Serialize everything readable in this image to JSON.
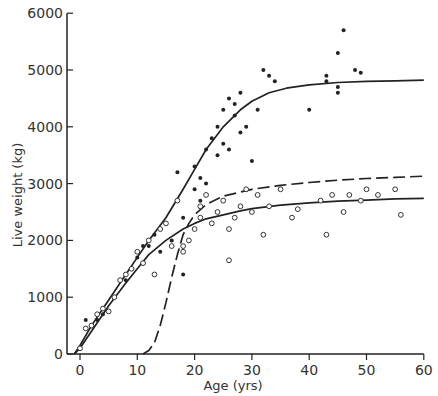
{
  "chart_data": {
    "type": "scatter",
    "title": "",
    "xlabel": "Age (yrs)",
    "ylabel": "Live weight (kg)",
    "xlim": [
      -2,
      60
    ],
    "ylim": [
      0,
      6000
    ],
    "xticks": [
      0,
      10,
      20,
      30,
      40,
      50,
      60
    ],
    "yticks": [
      0,
      1000,
      2000,
      3000,
      4000,
      5000,
      6000
    ],
    "grid": false,
    "legend": null,
    "series": [
      {
        "name": "filled points (males)",
        "marker": "filled-circle",
        "points": [
          [
            1,
            600
          ],
          [
            2,
            500
          ],
          [
            3,
            600
          ],
          [
            4,
            700
          ],
          [
            6,
            1000
          ],
          [
            8,
            1300
          ],
          [
            10,
            1700
          ],
          [
            11,
            1900
          ],
          [
            12,
            1900
          ],
          [
            13,
            2100
          ],
          [
            14,
            1800
          ],
          [
            15,
            2300
          ],
          [
            16,
            2000
          ],
          [
            17,
            3200
          ],
          [
            18,
            2400
          ],
          [
            18,
            1400
          ],
          [
            20,
            2900
          ],
          [
            20,
            3300
          ],
          [
            21,
            3100
          ],
          [
            21,
            2700
          ],
          [
            22,
            3000
          ],
          [
            22,
            3600
          ],
          [
            23,
            3800
          ],
          [
            24,
            3500
          ],
          [
            24,
            4000
          ],
          [
            25,
            3700
          ],
          [
            25,
            4300
          ],
          [
            26,
            3600
          ],
          [
            26,
            4500
          ],
          [
            27,
            4200
          ],
          [
            27,
            4400
          ],
          [
            28,
            3900
          ],
          [
            28,
            4600
          ],
          [
            29,
            4000
          ],
          [
            30,
            3400
          ],
          [
            31,
            4300
          ],
          [
            32,
            5000
          ],
          [
            33,
            4900
          ],
          [
            34,
            4800
          ],
          [
            40,
            4300
          ],
          [
            43,
            4800
          ],
          [
            43,
            4900
          ],
          [
            45,
            4600
          ],
          [
            45,
            4700
          ],
          [
            45,
            5300
          ],
          [
            46,
            5700
          ],
          [
            48,
            5000
          ],
          [
            49,
            4950
          ]
        ]
      },
      {
        "name": "open points (females)",
        "marker": "open-circle",
        "points": [
          [
            0,
            100
          ],
          [
            1,
            450
          ],
          [
            2,
            500
          ],
          [
            3,
            700
          ],
          [
            4,
            800
          ],
          [
            5,
            750
          ],
          [
            6,
            1000
          ],
          [
            7,
            1300
          ],
          [
            8,
            1400
          ],
          [
            9,
            1500
          ],
          [
            10,
            1800
          ],
          [
            11,
            1600
          ],
          [
            12,
            2000
          ],
          [
            13,
            1400
          ],
          [
            14,
            2200
          ],
          [
            15,
            2300
          ],
          [
            16,
            1900
          ],
          [
            17,
            2700
          ],
          [
            18,
            1800
          ],
          [
            18,
            1900
          ],
          [
            19,
            2000
          ],
          [
            20,
            2200
          ],
          [
            21,
            2400
          ],
          [
            21,
            2600
          ],
          [
            22,
            2800
          ],
          [
            23,
            2300
          ],
          [
            24,
            2500
          ],
          [
            25,
            2700
          ],
          [
            26,
            2200
          ],
          [
            26,
            1650
          ],
          [
            27,
            2400
          ],
          [
            28,
            2600
          ],
          [
            29,
            2900
          ],
          [
            30,
            2500
          ],
          [
            31,
            2800
          ],
          [
            32,
            2100
          ],
          [
            33,
            2600
          ],
          [
            35,
            2900
          ],
          [
            37,
            2400
          ],
          [
            38,
            2550
          ],
          [
            42,
            2700
          ],
          [
            43,
            2100
          ],
          [
            44,
            2800
          ],
          [
            46,
            2500
          ],
          [
            47,
            2800
          ],
          [
            49,
            2700
          ],
          [
            50,
            2900
          ],
          [
            52,
            2800
          ],
          [
            55,
            2900
          ],
          [
            56,
            2450
          ]
        ]
      },
      {
        "name": "upper fitted curve (males)",
        "type": "line",
        "style": "solid",
        "x": [
          -1,
          0,
          2,
          5,
          8,
          10,
          12,
          15,
          18,
          20,
          22,
          25,
          28,
          30,
          33,
          36,
          40,
          45,
          50,
          55,
          60
        ],
        "y": [
          0,
          150,
          500,
          950,
          1400,
          1700,
          2000,
          2400,
          2900,
          3250,
          3600,
          4000,
          4300,
          4450,
          4600,
          4680,
          4740,
          4780,
          4800,
          4810,
          4820
        ]
      },
      {
        "name": "lower fitted curve (females)",
        "type": "line",
        "style": "solid",
        "x": [
          -1,
          0,
          2,
          5,
          8,
          10,
          12,
          15,
          18,
          20,
          22,
          25,
          28,
          30,
          35,
          40,
          45,
          50,
          55,
          60
        ],
        "y": [
          0,
          100,
          400,
          850,
          1250,
          1500,
          1750,
          2000,
          2200,
          2300,
          2380,
          2450,
          2520,
          2560,
          2620,
          2660,
          2690,
          2710,
          2730,
          2740
        ]
      },
      {
        "name": "dashed curve",
        "type": "line",
        "style": "dashed",
        "x": [
          11,
          12,
          13,
          14,
          15,
          16,
          17,
          18,
          19,
          20,
          22,
          25,
          30,
          35,
          40,
          45,
          50,
          55,
          60
        ],
        "y": [
          0,
          60,
          200,
          500,
          900,
          1350,
          1750,
          2100,
          2300,
          2450,
          2630,
          2780,
          2900,
          2970,
          3020,
          3060,
          3090,
          3110,
          3130
        ]
      }
    ]
  }
}
